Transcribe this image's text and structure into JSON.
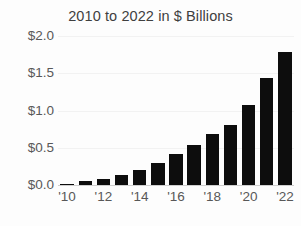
{
  "chart_data": {
    "type": "bar",
    "title": "2010 to 2022 in $ Billions",
    "xlabel": "",
    "ylabel": "",
    "categories": [
      "'10",
      "'11",
      "'12",
      "'13",
      "'14",
      "'15",
      "'16",
      "'17",
      "'18",
      "'19",
      "'20",
      "'21",
      "'22"
    ],
    "values": [
      0.02,
      0.05,
      0.08,
      0.14,
      0.2,
      0.3,
      0.41,
      0.54,
      0.68,
      0.8,
      1.07,
      1.44,
      1.79
    ],
    "ylim": [
      0.0,
      2.0
    ],
    "ytick_values": [
      0.0,
      0.5,
      1.0,
      1.5,
      2.0
    ],
    "ytick_labels": [
      "$0.0",
      "$0.5",
      "$1.0",
      "$1.5",
      "$2.0"
    ],
    "xtick_labels": [
      "'10",
      "'12",
      "'14",
      "'16",
      "'18",
      "'20",
      "'22"
    ],
    "xtick_indices": [
      0,
      2,
      4,
      6,
      8,
      10,
      12
    ],
    "grid": true,
    "legend": false,
    "bar_color": "#0d0d0d",
    "gridline_color": "#f2f2f2",
    "axis_color": "#cfcfcf",
    "text_color": "#585858",
    "title_color": "#3f3f3f",
    "background_color": "#fdfdfd"
  }
}
